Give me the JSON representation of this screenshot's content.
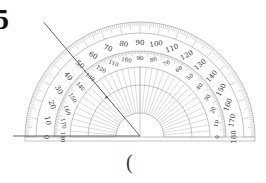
{
  "question": {
    "number_fragment": "5",
    "answer_paren": "("
  },
  "protractor": {
    "outer_scale_labels": [
      "0",
      "10",
      "20",
      "30",
      "40",
      "50",
      "60",
      "70",
      "80",
      "90",
      "100",
      "110",
      "120",
      "130",
      "140",
      "150",
      "160",
      "170",
      "180"
    ],
    "inner_scale_labels": [
      "180",
      "170",
      "160",
      "150",
      "140",
      "130",
      "120",
      "110",
      "100",
      "90",
      "80",
      "70",
      "60",
      "50",
      "40",
      "30",
      "20",
      "10",
      "0"
    ],
    "colors": {
      "scale": "#9a9a9a",
      "label": "#333333",
      "line": "#555555"
    }
  },
  "angle": {
    "ray_outer_reading_deg": 50,
    "ray_inner_reading_deg": 130,
    "baseline_reading_deg": 0
  }
}
